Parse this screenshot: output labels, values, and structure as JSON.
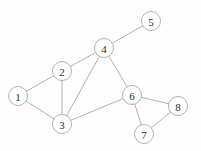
{
  "diagram": {
    "type": "node-link-graph",
    "width": 201,
    "height": 151,
    "background_color": "#fefefe",
    "node_fill_color": "#ffffff",
    "node_stroke_color": "#b2b2b2",
    "node_label_color": "#2b2b2b",
    "edge_color": "#a9a9a9",
    "node_radius": 9.5,
    "nodes": [
      {
        "id": "1",
        "label": "1",
        "x": 18,
        "y": 96
      },
      {
        "id": "2",
        "label": "2",
        "x": 62,
        "y": 71
      },
      {
        "id": "3",
        "label": "3",
        "x": 62,
        "y": 124
      },
      {
        "id": "4",
        "label": "4",
        "x": 104,
        "y": 48
      },
      {
        "id": "5",
        "label": "5",
        "x": 151,
        "y": 21
      },
      {
        "id": "6",
        "label": "6",
        "x": 132,
        "y": 95
      },
      {
        "id": "7",
        "label": "7",
        "x": 144,
        "y": 134
      },
      {
        "id": "8",
        "label": "8",
        "x": 178,
        "y": 106
      }
    ],
    "edges": [
      {
        "source": "1",
        "target": "2"
      },
      {
        "source": "1",
        "target": "3"
      },
      {
        "source": "2",
        "target": "3"
      },
      {
        "source": "2",
        "target": "4"
      },
      {
        "source": "3",
        "target": "4"
      },
      {
        "source": "3",
        "target": "6"
      },
      {
        "source": "4",
        "target": "5"
      },
      {
        "source": "4",
        "target": "6"
      },
      {
        "source": "6",
        "target": "7"
      },
      {
        "source": "6",
        "target": "8"
      },
      {
        "source": "7",
        "target": "8"
      }
    ]
  }
}
